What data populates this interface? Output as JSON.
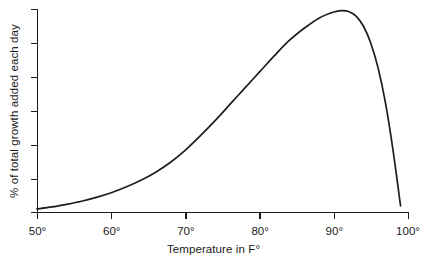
{
  "chart_data": {
    "type": "line",
    "title": "",
    "subtitle": "",
    "xlabel": "Temperature in F°",
    "ylabel": "% of total growth added each day",
    "xlim": [
      50,
      100
    ],
    "ylim": [
      0,
      100
    ],
    "grid": false,
    "legend": null,
    "legend_position": "none",
    "annotations": [],
    "x_tick_labels": [
      "50°",
      "60°",
      "70°",
      "80°",
      "90°",
      "100°"
    ],
    "x_tick_values": [
      50,
      60,
      70,
      80,
      90,
      100
    ],
    "y_tick_labels": [
      "",
      "",
      "",
      "",
      "",
      "",
      ""
    ],
    "y_tick_values": [
      0,
      16.7,
      33.3,
      50,
      66.7,
      83.3,
      100
    ],
    "series": [
      {
        "name": "growth rate",
        "color": "#1d1d1d",
        "x": [
          50,
          52,
          54,
          56,
          58,
          60,
          62,
          64,
          66,
          68,
          70,
          72,
          74,
          76,
          78,
          80,
          82,
          84,
          86,
          88,
          90,
          91,
          92,
          93,
          94,
          95,
          96,
          97,
          98,
          99
        ],
        "values": [
          1.5,
          2.5,
          3.8,
          5.3,
          7.2,
          9.5,
          12.3,
          15.6,
          19.6,
          24.5,
          30.5,
          37.5,
          45.0,
          53.0,
          61.0,
          69.0,
          77.0,
          84.5,
          90.5,
          95.5,
          98.5,
          99.2,
          98.8,
          96.5,
          91.5,
          83.0,
          70.5,
          53.0,
          30.0,
          3.0
        ]
      }
    ]
  },
  "plot_geometry": {
    "origin_x": 37,
    "origin_y": 212,
    "axis_top_y": 9,
    "axis_right_x": 408
  }
}
